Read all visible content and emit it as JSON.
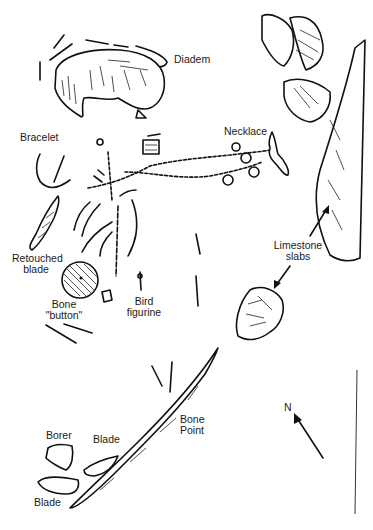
{
  "figure": {
    "type": "archaeological burial site plan",
    "labels": {
      "diadem": "Diadem",
      "necklace": "Necklace",
      "bracelet": "Bracelet",
      "retouched_blade_1": "Retouched",
      "retouched_blade_2": "blade",
      "bone_button_1": "Bone",
      "bone_button_2": "\"button\"",
      "bird_figurine_1": "Bird",
      "bird_figurine_2": "figurine",
      "limestone_slabs_1": "Limestone",
      "limestone_slabs_2": "slabs",
      "bone_point_1": "Bone",
      "bone_point_2": "Point",
      "borer": "Borer",
      "blade_upper": "Blade",
      "blade_lower": "Blade",
      "north": "N"
    },
    "north_arrow": {
      "direction": "north-west"
    },
    "colors": {
      "ink": "#111111",
      "background": "#ffffff"
    }
  }
}
